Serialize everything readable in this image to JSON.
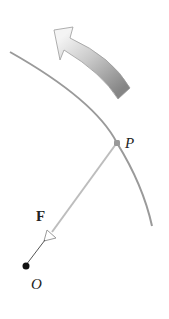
{
  "diagram": {
    "labels": {
      "point_p": "P",
      "force": "F",
      "origin": "O"
    },
    "colors": {
      "arc": "#9a9a9a",
      "line": "#b8b8b8",
      "dot": "#111111",
      "p_dot": "#999999",
      "arrow_light": "#f2f2f2",
      "arrow_dark": "#8a8a8a",
      "text": "#222222"
    },
    "icons": {
      "rotation_arrow": "curved-arrow-counterclockwise",
      "force_arrowhead": "open-triangle-arrowhead"
    }
  }
}
